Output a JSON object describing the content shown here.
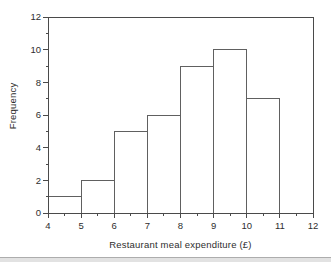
{
  "figure": {
    "colors": {
      "background": "#ffffff",
      "frame": "#4a4a4a",
      "tick": "#4a4a4a",
      "bar_stroke": "#606060",
      "bar_fill": "#ffffff",
      "text": "#2e2e2e",
      "scan_line_dark": "#adadad",
      "scan_line_light": "#e2e2e2"
    }
  },
  "chart_data": {
    "type": "bar",
    "subtype": "histogram",
    "title": "",
    "xlabel": "Restaurant meal expenditure (£)",
    "ylabel": "Frequency",
    "bin_edges": [
      4,
      5,
      6,
      7,
      8,
      9,
      10,
      11
    ],
    "frequencies": [
      1,
      2,
      5,
      6,
      9,
      10,
      7
    ],
    "categories": [
      "4-5",
      "5-6",
      "6-7",
      "7-8",
      "8-9",
      "9-10",
      "10-11"
    ],
    "xlim": [
      4,
      12
    ],
    "ylim": [
      0,
      12
    ],
    "x_major_ticks": [
      4,
      5,
      6,
      7,
      8,
      9,
      10,
      11,
      12
    ],
    "x_minor_ticks": [
      4.5,
      5.5,
      6.5,
      7.5,
      8.5,
      9.5,
      10.5,
      11.5
    ],
    "y_major_ticks": [
      0,
      2,
      4,
      6,
      8,
      10,
      12
    ],
    "y_minor_ticks": [
      1,
      3,
      5,
      7,
      9,
      11
    ],
    "grid": false,
    "legend": "none"
  }
}
